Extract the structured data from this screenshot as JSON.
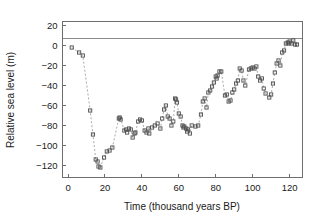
{
  "chart_data": {
    "type": "line",
    "title": "",
    "xlabel": "Time (thousand years BP)",
    "ylabel": "Relative sea level (m)",
    "xlim": [
      -3,
      127
    ],
    "ylim": [
      -132,
      24
    ],
    "xticks": [
      0,
      20,
      40,
      60,
      80,
      100,
      120
    ],
    "yticks": [
      20,
      0,
      -20,
      -40,
      -60,
      -80,
      -100,
      -120
    ],
    "xtick_labels": [
      "0",
      "20",
      "40",
      "60",
      "80",
      "100",
      "120"
    ],
    "ytick_labels": [
      "20",
      "0",
      "-20",
      "-40",
      "-60",
      "-80",
      "-100",
      "-120"
    ],
    "grid": false,
    "legend": false,
    "marker": "open-square",
    "linestyle": "dashed",
    "series_name": "Relative sea level",
    "x": [
      2,
      6,
      8,
      12,
      13.5,
      15,
      16,
      16.5,
      17.5,
      19.5,
      21,
      22.5,
      24,
      27.5,
      28,
      28.5,
      30.5,
      31.5,
      32,
      33,
      34,
      35,
      36,
      36.5,
      38,
      39,
      40,
      41.5,
      42.5,
      43.5,
      44,
      45.5,
      47,
      48.5,
      50,
      51,
      52,
      53,
      54,
      55,
      56,
      57,
      58,
      58.5,
      59,
      60,
      61,
      62,
      62.5,
      63,
      64,
      64.5,
      65,
      66,
      67,
      69,
      70.5,
      72,
      73,
      74,
      75,
      76,
      77,
      78,
      79,
      80,
      80.5,
      81,
      82,
      83,
      85,
      86,
      87,
      88,
      89,
      90,
      91,
      92,
      93,
      94,
      95,
      96,
      98,
      99,
      100,
      101,
      102,
      103,
      104,
      105,
      106,
      107,
      109,
      110,
      111,
      112,
      113,
      114,
      115,
      116,
      117,
      118,
      119,
      119.5,
      120,
      121,
      122,
      123,
      124
    ],
    "y": [
      -2,
      -7,
      -10,
      -65,
      -89,
      -114,
      -116,
      -121,
      -122,
      -112,
      -106,
      -105,
      -102,
      -73,
      -72,
      -74,
      -85,
      -84,
      -87,
      -83,
      -84,
      -92,
      -88,
      -87,
      -76,
      -74,
      -75,
      -85,
      -87,
      -83,
      -88,
      -82,
      -80,
      -78,
      -83,
      -73,
      -64,
      -60,
      -71,
      -73,
      -80,
      -76,
      -53,
      -54,
      -57,
      -68,
      -71,
      -80,
      -82,
      -81,
      -83,
      -86,
      -84,
      -88,
      -80,
      -81,
      -80,
      -69,
      -56,
      -53,
      -62,
      -47,
      -45,
      -41,
      -37,
      -31,
      -33,
      -30,
      -26,
      -26,
      -50,
      -49,
      -56,
      -55,
      -47,
      -44,
      -38,
      -35,
      -23,
      -25,
      -35,
      -40,
      -24,
      -23,
      -22,
      -23,
      -21,
      -31,
      -35,
      -33,
      -43,
      -48,
      -52,
      -49,
      -38,
      -27,
      -18,
      -15,
      -20,
      -7,
      -5,
      2,
      3,
      2,
      4,
      2,
      5,
      1,
      1
    ]
  },
  "axis": {
    "xlabel": "Time (thousand years BP)",
    "ylabel": "Relative sea level (m)"
  }
}
